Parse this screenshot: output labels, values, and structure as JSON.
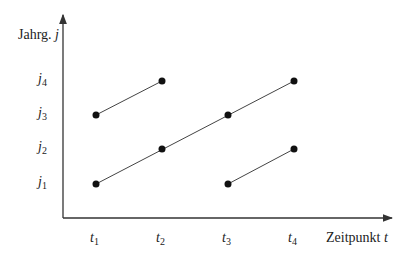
{
  "axes": {
    "y_label_text": "Jahrg.",
    "y_label_var": "j",
    "x_label_text": "Zeitpunkt",
    "x_label_var": "t"
  },
  "y_ticks": [
    {
      "var": "j",
      "sub": "4",
      "y": 81
    },
    {
      "var": "j",
      "sub": "3",
      "y": 115
    },
    {
      "var": "j",
      "sub": "2",
      "y": 149
    },
    {
      "var": "j",
      "sub": "1",
      "y": 184
    }
  ],
  "x_ticks": [
    {
      "var": "t",
      "sub": "1",
      "x": 96
    },
    {
      "var": "t",
      "sub": "2",
      "x": 162
    },
    {
      "var": "t",
      "sub": "3",
      "x": 228
    },
    {
      "var": "t",
      "sub": "4",
      "x": 294
    }
  ],
  "segments": [
    {
      "from": [
        "t1",
        "j3"
      ],
      "to": [
        "t2",
        "j4"
      ]
    },
    {
      "from": [
        "t1",
        "j1"
      ],
      "to": [
        "t4",
        "j4"
      ],
      "through": [
        [
          "t2",
          "j2"
        ],
        [
          "t3",
          "j3"
        ]
      ]
    },
    {
      "from": [
        "t3",
        "j1"
      ],
      "to": [
        "t4",
        "j2"
      ]
    }
  ],
  "points": [
    [
      "t1",
      "j1"
    ],
    [
      "t1",
      "j3"
    ],
    [
      "t2",
      "j2"
    ],
    [
      "t2",
      "j4"
    ],
    [
      "t3",
      "j1"
    ],
    [
      "t3",
      "j3"
    ],
    [
      "t4",
      "j2"
    ],
    [
      "t4",
      "j4"
    ]
  ],
  "colors": {
    "axis": "#333333",
    "line": "#444444",
    "point": "#111111"
  }
}
